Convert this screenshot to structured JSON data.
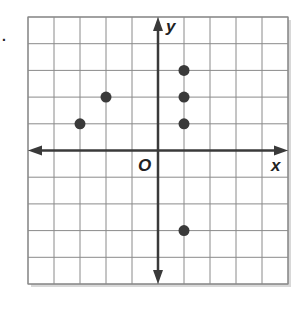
{
  "problem_marker": ".",
  "chart_data": {
    "type": "scatter",
    "title": "",
    "xlabel": "x",
    "ylabel": "y",
    "origin_label": "O",
    "xlim": [
      -5,
      5
    ],
    "ylim": [
      -5,
      5
    ],
    "grid": true,
    "tick_labels": false,
    "legend": null,
    "points": [
      {
        "x": -3,
        "y": 1
      },
      {
        "x": -2,
        "y": 2
      },
      {
        "x": 1,
        "y": 1
      },
      {
        "x": 1,
        "y": 2
      },
      {
        "x": 1,
        "y": 3
      },
      {
        "x": 1,
        "y": -3
      }
    ]
  },
  "colors": {
    "grid": "#8a8a8a",
    "axis": "#3a3a3a",
    "point": "#3a3a3a",
    "label": "#222222",
    "shadow": "#d8d8d8"
  }
}
